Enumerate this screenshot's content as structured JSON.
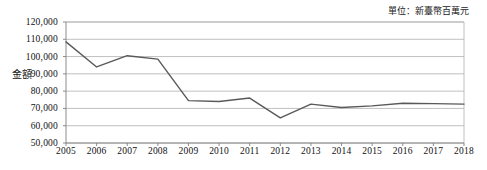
{
  "unit_note": "單位：新臺幣百萬元",
  "axis_title": "金額",
  "chart_data": {
    "type": "line",
    "title": "",
    "subtitle": "",
    "xlabel": "",
    "ylabel": "金額",
    "unit": "單位：新臺幣百萬元",
    "grid": true,
    "legend": false,
    "legend_position": "none",
    "xlim": [
      2005,
      2018
    ],
    "ylim": [
      50000,
      120000
    ],
    "ytick_step": 10000,
    "yticks": [
      50000,
      60000,
      70000,
      80000,
      90000,
      100000,
      110000,
      120000
    ],
    "ytick_labels": [
      "50,000",
      "60,000",
      "70,000",
      "80,000",
      "90,000",
      "100,000",
      "110,000",
      "120,000"
    ],
    "categories": [
      2005,
      2006,
      2007,
      2008,
      2009,
      2010,
      2011,
      2012,
      2013,
      2014,
      2015,
      2016,
      2017,
      2018
    ],
    "xtick_labels": [
      "2005",
      "2006",
      "2007",
      "2008",
      "2009",
      "2010",
      "2011",
      "2012",
      "2013",
      "2014",
      "2015",
      "2016",
      "2017",
      "2018"
    ],
    "values": [
      108500,
      94000,
      100500,
      98500,
      74500,
      74000,
      76000,
      64500,
      72500,
      70500,
      71500,
      73000,
      72800,
      72500
    ],
    "series": [
      {
        "name": "金額",
        "color": "#595959",
        "values": [
          108500,
          94000,
          100500,
          98500,
          74500,
          74000,
          76000,
          64500,
          72500,
          70500,
          71500,
          73000,
          72800,
          72500
        ]
      }
    ]
  }
}
